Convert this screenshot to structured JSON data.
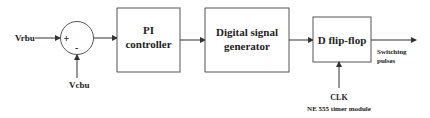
{
  "diagram": {
    "inputs": {
      "reference": "Vrbu",
      "feedback": "Vcbu"
    },
    "summing_junction": {
      "plus_sign": "+",
      "minus_sign": "-"
    },
    "blocks": {
      "pi_controller": {
        "line1": "PI",
        "line2": "controller"
      },
      "signal_generator": {
        "line1": "Digital signal",
        "line2": "generator"
      },
      "flip_flop": {
        "label": "D flip-flop"
      }
    },
    "output": {
      "line1": "Switching",
      "line2": "pulses"
    },
    "clock": {
      "label": "CLK",
      "source": "NE 555 timer module"
    },
    "colors": {
      "line": "#333333",
      "box_border": "#555555",
      "text": "#222222",
      "background": "#ffffff"
    }
  }
}
